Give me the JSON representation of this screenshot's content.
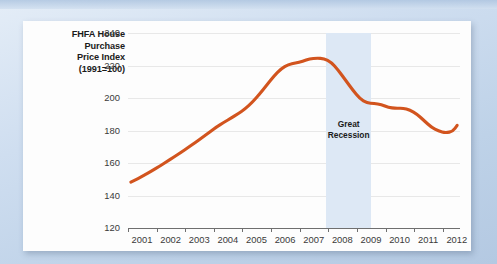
{
  "figure": {
    "background_color": "#c9d9ec",
    "panel_color": "#fdfdfd"
  },
  "chart_data": {
    "type": "line",
    "title": "",
    "ylabel": "FHFA House Purchase Price Index (1991=100)",
    "ylabel_lines": [
      "FHFA House",
      "Purchase",
      "Price Index",
      "(1991=100)"
    ],
    "xlabel": "",
    "ylim": [
      120,
      240
    ],
    "ytick_values": [
      120,
      140,
      160,
      180,
      200,
      220,
      240
    ],
    "ytick_labels": [
      "120",
      "140",
      "160",
      "180",
      "200",
      "220",
      "240"
    ],
    "xlim": [
      2001.0,
      2012.6
    ],
    "xtick_values": [
      2001,
      2002,
      2003,
      2004,
      2005,
      2006,
      2007,
      2008,
      2009,
      2010,
      2011,
      2012
    ],
    "xtick_labels": [
      "2001",
      "2002",
      "2003",
      "2004",
      "2005",
      "2006",
      "2007",
      "2008",
      "2009",
      "2010",
      "2011",
      "2012"
    ],
    "grid": true,
    "legend": false,
    "line_color": "#d2541e",
    "line_width": 3.1,
    "annotations": [
      {
        "name": "great-recession",
        "label": "Great Recession",
        "label_lines": [
          "Great",
          "Recession"
        ],
        "type": "vspan",
        "x_start": 2007.92,
        "x_end": 2009.5,
        "color": "#dde8f5"
      }
    ],
    "series": [
      {
        "name": "FHFA House Purchase Price Index",
        "color": "#d2541e",
        "x": [
          2001.1,
          2001.35,
          2001.6,
          2001.85,
          2002.1,
          2002.35,
          2002.6,
          2002.85,
          2003.1,
          2003.35,
          2003.6,
          2003.85,
          2004.1,
          2004.35,
          2004.6,
          2004.85,
          2005.1,
          2005.35,
          2005.6,
          2005.85,
          2006.1,
          2006.35,
          2006.6,
          2006.85,
          2007.1,
          2007.35,
          2007.6,
          2007.85,
          2008.1,
          2008.35,
          2008.6,
          2008.85,
          2009.1,
          2009.35,
          2009.6,
          2009.85,
          2010.1,
          2010.35,
          2010.6,
          2010.85,
          2011.1,
          2011.35,
          2011.6,
          2011.85,
          2012.1,
          2012.35,
          2012.5
        ],
        "y": [
          148.2,
          150.4,
          152.8,
          155.3,
          158.0,
          160.8,
          163.6,
          166.5,
          169.5,
          172.6,
          175.8,
          179.0,
          182.3,
          185.0,
          187.6,
          190.4,
          193.4,
          197.5,
          202.5,
          208.0,
          213.5,
          218.0,
          220.6,
          221.5,
          222.6,
          224.2,
          224.5,
          224.3,
          222.0,
          217.0,
          211.0,
          205.0,
          199.5,
          197.0,
          196.6,
          196.0,
          194.2,
          193.6,
          193.8,
          192.6,
          190.0,
          186.0,
          182.0,
          179.6,
          178.5,
          179.5,
          183.2
        ]
      }
    ]
  }
}
